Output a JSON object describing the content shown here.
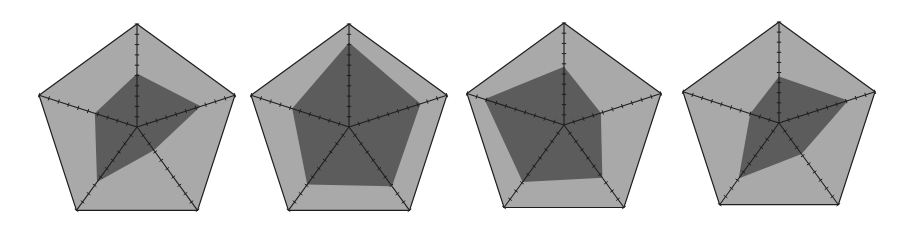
{
  "colors": {
    "background": "#ffffff",
    "outer_fill": "#a9a9a9",
    "data_fill": "#5c5c5c",
    "stroke": "#1e1e1e"
  },
  "chart_data": [
    {
      "type": "radar",
      "title": "",
      "axes": [
        "A1",
        "A2",
        "A3",
        "A4",
        "A5"
      ],
      "axis_labels_visible": false,
      "ticks_per_axis": 10,
      "range": [
        0,
        1
      ],
      "center": [
        137,
        127
      ],
      "radius": 103,
      "values": [
        0.52,
        0.65,
        0.28,
        0.66,
        0.43
      ]
    },
    {
      "type": "radar",
      "title": "",
      "axes": [
        "A1",
        "A2",
        "A3",
        "A4",
        "A5"
      ],
      "axis_labels_visible": false,
      "ticks_per_axis": 10,
      "range": [
        0,
        1
      ],
      "center": [
        349,
        127
      ],
      "radius": 103,
      "values": [
        0.82,
        0.73,
        0.71,
        0.69,
        0.58
      ]
    },
    {
      "type": "radar",
      "title": "",
      "axes": [
        "A1",
        "A2",
        "A3",
        "A4",
        "A5"
      ],
      "axis_labels_visible": false,
      "ticks_per_axis": 10,
      "range": [
        0,
        1
      ],
      "center": [
        564,
        125
      ],
      "radius": 102,
      "values": [
        0.57,
        0.38,
        0.64,
        0.69,
        0.82
      ]
    },
    {
      "type": "radar",
      "title": "",
      "axes": [
        "A1",
        "A2",
        "A3",
        "A4",
        "A5"
      ],
      "axis_labels_visible": false,
      "ticks_per_axis": 10,
      "range": [
        0,
        1
      ],
      "center": [
        779,
        123
      ],
      "radius": 101,
      "values": [
        0.46,
        0.72,
        0.38,
        0.68,
        0.3
      ]
    }
  ]
}
